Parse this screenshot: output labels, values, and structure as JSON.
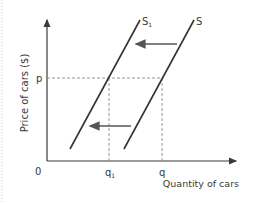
{
  "diagram": {
    "y_axis_label": "Price of cars ($)",
    "x_axis_label": "Quantity of cars",
    "origin_label": "0",
    "price_label": "p",
    "q_label": "q",
    "q1_label": "q",
    "q1_subscript": "1",
    "curves": [
      {
        "name": "S",
        "label": "S",
        "subscript": ""
      },
      {
        "name": "S1",
        "label": "S",
        "subscript": "1"
      }
    ],
    "shift_direction": "left",
    "colors": {
      "axis": "#3a3a3a",
      "curve": "#333333",
      "dashed": "#8a8a8a",
      "arrow": "#555555",
      "border_dots": "#c8c8c8"
    }
  }
}
